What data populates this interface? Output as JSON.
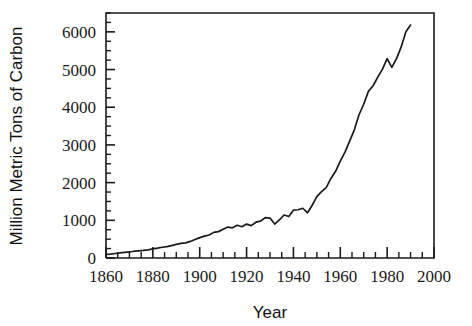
{
  "chart_data": {
    "type": "line",
    "title": "",
    "subtitle": "",
    "xlabel": "Year",
    "ylabel": "Million Metric Tons of Carbon",
    "xlim": [
      1860,
      2000
    ],
    "ylim": [
      0,
      6500
    ],
    "grid": false,
    "legend": null,
    "x_major_ticks": [
      1860,
      1880,
      1900,
      1920,
      1940,
      1960,
      1980,
      2000
    ],
    "x_major_tick_labels": [
      "1860",
      "1880",
      "1900",
      "1920",
      "1940",
      "1960",
      "1980",
      "2000"
    ],
    "x_minor_tick_step": 5,
    "y_major_ticks": [
      0,
      1000,
      2000,
      3000,
      4000,
      5000,
      6000
    ],
    "y_major_tick_labels": [
      "0",
      "1000",
      "2000",
      "3000",
      "4000",
      "5000",
      "6000"
    ],
    "y_minor_tick_step": 250,
    "line_color": "#1a1a1a",
    "frame_color": "#1a1a1a",
    "background_color": "#ffffff",
    "series": [
      {
        "name": "Global carbon emissions from fossil fuels",
        "x": [
          1860,
          1862,
          1864,
          1866,
          1868,
          1870,
          1872,
          1874,
          1876,
          1878,
          1880,
          1882,
          1884,
          1886,
          1888,
          1890,
          1892,
          1894,
          1896,
          1898,
          1900,
          1902,
          1904,
          1906,
          1908,
          1910,
          1912,
          1914,
          1916,
          1918,
          1920,
          1922,
          1924,
          1926,
          1928,
          1930,
          1932,
          1934,
          1936,
          1938,
          1940,
          1942,
          1944,
          1946,
          1948,
          1950,
          1952,
          1954,
          1956,
          1958,
          1960,
          1962,
          1964,
          1966,
          1968,
          1970,
          1972,
          1974,
          1976,
          1978,
          1980,
          1982,
          1984,
          1986,
          1988,
          1990
        ],
        "values": [
          95,
          105,
          120,
          135,
          150,
          160,
          180,
          190,
          200,
          215,
          240,
          260,
          285,
          300,
          330,
          360,
          390,
          400,
          440,
          490,
          540,
          580,
          610,
          680,
          700,
          760,
          820,
          800,
          870,
          830,
          900,
          860,
          950,
          980,
          1070,
          1060,
          900,
          1010,
          1140,
          1100,
          1270,
          1280,
          1320,
          1200,
          1400,
          1630,
          1760,
          1870,
          2110,
          2300,
          2570,
          2810,
          3100,
          3400,
          3800,
          4080,
          4420,
          4570,
          4800,
          5010,
          5290,
          5060,
          5290,
          5600,
          6000,
          6180
        ]
      }
    ],
    "annotations": []
  },
  "layout": {
    "plot_left": 106,
    "plot_right": 434,
    "plot_top": 13,
    "plot_bottom": 258
  }
}
